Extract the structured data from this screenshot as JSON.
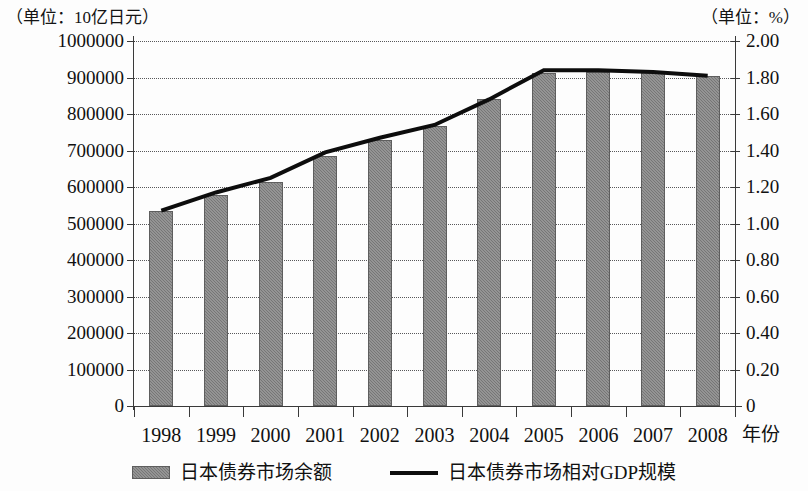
{
  "chart_data": {
    "type": "bar",
    "title": "",
    "subtitle": "",
    "xlabel": "年份",
    "categories": [
      "1998",
      "1999",
      "2000",
      "2001",
      "2002",
      "2003",
      "2004",
      "2005",
      "2006",
      "2007",
      "2008"
    ],
    "grid": true,
    "legend_position": "bottom",
    "axes": {
      "left": {
        "unit_caption": "（单位：10亿日元）",
        "label": "",
        "lim": [
          0,
          1000000
        ],
        "tick_step": 100000,
        "ticks": [
          "1000000",
          "900000",
          "800000",
          "700000",
          "600000",
          "500000",
          "400000",
          "300000",
          "200000",
          "100000",
          "0"
        ],
        "tick_values": [
          1000000,
          900000,
          800000,
          700000,
          600000,
          500000,
          400000,
          300000,
          200000,
          100000,
          0
        ]
      },
      "right": {
        "unit_caption": "（单位：%）",
        "label": "",
        "lim": [
          0,
          2.0
        ],
        "tick_step": 0.2,
        "ticks": [
          "2.00",
          "1.80",
          "1.60",
          "1.40",
          "1.20",
          "1.00",
          "0.80",
          "0.60",
          "0.40",
          "0.20",
          "0"
        ],
        "tick_values": [
          2.0,
          1.8,
          1.6,
          1.4,
          1.2,
          1.0,
          0.8,
          0.6,
          0.4,
          0.2,
          0
        ]
      }
    },
    "series": [
      {
        "name": "日本债券市场余额",
        "kind": "bar",
        "axis": "left",
        "color": "#767676",
        "values": [
          534000,
          578000,
          613000,
          686000,
          728000,
          767000,
          841000,
          912000,
          915000,
          917000,
          905000
        ]
      },
      {
        "name": "日本债券市场相对GDP规模",
        "kind": "line",
        "axis": "right",
        "color": "#0d0d0d",
        "values": [
          1.07,
          1.17,
          1.25,
          1.39,
          1.47,
          1.54,
          1.68,
          1.84,
          1.84,
          1.83,
          1.81
        ]
      }
    ]
  },
  "legend": {
    "items": [
      {
        "label": "日本债券市场余额",
        "marker": "bar-swatch"
      },
      {
        "label": "日本债券市场相对GDP规模",
        "marker": "line-swatch"
      }
    ]
  }
}
